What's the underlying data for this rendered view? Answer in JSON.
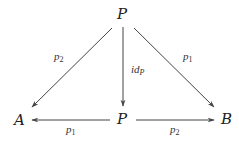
{
  "diagram": {
    "type": "commutative-diagram",
    "nodes": {
      "top": {
        "label": "P"
      },
      "center": {
        "label": "P"
      },
      "left": {
        "label": "A"
      },
      "right": {
        "label": "B"
      }
    },
    "edges": [
      {
        "from": "top",
        "to": "left",
        "label_base": "p",
        "label_sub": "2"
      },
      {
        "from": "top",
        "to": "center",
        "label_base": "id",
        "label_sub": "P"
      },
      {
        "from": "top",
        "to": "right",
        "label_base": "p",
        "label_sub": "1"
      },
      {
        "from": "center",
        "to": "left",
        "label_base": "p",
        "label_sub": "1"
      },
      {
        "from": "center",
        "to": "right",
        "label_base": "p",
        "label_sub": "2"
      }
    ]
  }
}
